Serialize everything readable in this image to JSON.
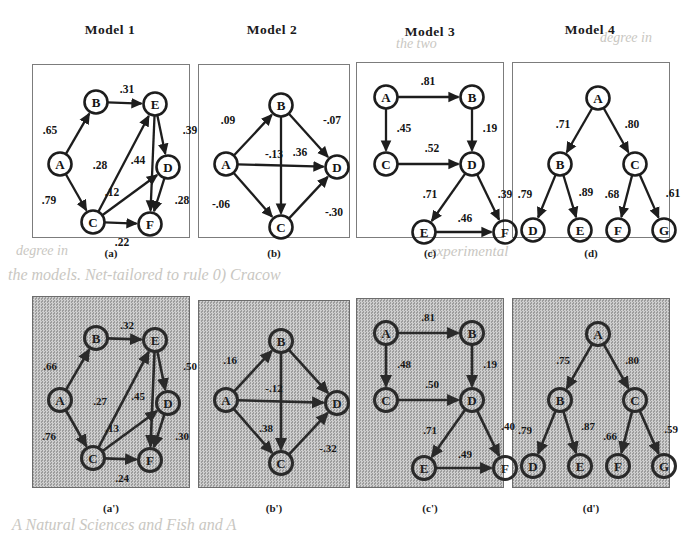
{
  "figure": {
    "title_row": [
      "Model 1",
      "Model 2",
      "Model 3",
      "Model 4"
    ],
    "captions_top": [
      "(a)",
      "(b)",
      "(c)",
      "(d)"
    ],
    "captions_bottom": [
      "(a')",
      "(b')",
      "(c')",
      "(d')"
    ],
    "background_bleed_text": [
      "the two",
      "experimental",
      "degree in",
      "the models. Net-tailored to rule 0) Cracow",
      "A Natural Sciences and Fish and A",
      "degree in"
    ]
  },
  "colors": {
    "ink": "#1d1d1d",
    "panel_border": "#7c7c7c",
    "panel_background": "#ffffff",
    "dithered_background": "#b9b9b9",
    "bleed_text": "#c9c7c2"
  },
  "chart_data": [
    {
      "type": "diagram",
      "id": "model-1-a",
      "title": "Model 1",
      "caption": "(a)",
      "style": "clean",
      "nodes": [
        {
          "id": "A",
          "label": "A",
          "x": 22,
          "y": 92
        },
        {
          "id": "B",
          "label": "B",
          "x": 58,
          "y": 30
        },
        {
          "id": "C",
          "label": "C",
          "x": 55,
          "y": 150
        },
        {
          "id": "D",
          "label": "D",
          "x": 130,
          "y": 95
        },
        {
          "id": "E",
          "label": "E",
          "x": 117,
          "y": 32
        },
        {
          "id": "F",
          "label": "F",
          "x": 112,
          "y": 152
        }
      ],
      "edges": [
        {
          "from": "A",
          "to": "B",
          "weight": ".65",
          "lx": 12,
          "ly": 58
        },
        {
          "from": "B",
          "to": "E",
          "weight": ".31",
          "lx": 89,
          "ly": 17
        },
        {
          "from": "A",
          "to": "C",
          "weight": ".79",
          "lx": 11,
          "ly": 128
        },
        {
          "from": "C",
          "to": "E",
          "weight": ".28",
          "lx": 62,
          "ly": 93
        },
        {
          "from": "C",
          "to": "D",
          "weight": ".12",
          "lx": 74,
          "ly": 120
        },
        {
          "from": "E",
          "to": "D",
          "weight": ".39",
          "lx": 152,
          "ly": 58
        },
        {
          "from": "E",
          "to": "F",
          "weight": ".44",
          "lx": 100,
          "ly": 88
        },
        {
          "from": "D",
          "to": "F",
          "weight": ".28",
          "lx": 144,
          "ly": 128
        },
        {
          "from": "C",
          "to": "F",
          "weight": ".22",
          "lx": 84,
          "ly": 170
        }
      ]
    },
    {
      "type": "diagram",
      "id": "model-2-b",
      "title": "Model 2",
      "caption": "(b)",
      "style": "clean",
      "nodes": [
        {
          "id": "A",
          "label": "A",
          "x": 22,
          "y": 92
        },
        {
          "id": "B",
          "label": "B",
          "x": 77,
          "y": 33
        },
        {
          "id": "C",
          "label": "C",
          "x": 77,
          "y": 155
        },
        {
          "id": "D",
          "label": "D",
          "x": 133,
          "y": 95
        }
      ],
      "edges": [
        {
          "from": "A",
          "to": "B",
          "weight": ".09",
          "lx": 24,
          "ly": 48
        },
        {
          "from": "B",
          "to": "D",
          "weight": "-.07",
          "lx": 128,
          "ly": 48
        },
        {
          "from": "A",
          "to": "D",
          "weight": "-.13",
          "lx": 70,
          "ly": 82
        },
        {
          "from": "B",
          "to": "C",
          "weight": ".36",
          "lx": 96,
          "ly": 80
        },
        {
          "from": "A",
          "to": "C",
          "weight": "-.06",
          "lx": 17,
          "ly": 132
        },
        {
          "from": "C",
          "to": "D",
          "weight": "-.30",
          "lx": 130,
          "ly": 140
        }
      ]
    },
    {
      "type": "diagram",
      "id": "model-3-c",
      "title": "Model 3",
      "caption": "(c)",
      "style": "clean",
      "nodes": [
        {
          "id": "A",
          "label": "A",
          "x": 24,
          "y": 25
        },
        {
          "id": "B",
          "label": "B",
          "x": 110,
          "y": 25
        },
        {
          "id": "C",
          "label": "C",
          "x": 24,
          "y": 92
        },
        {
          "id": "D",
          "label": "D",
          "x": 110,
          "y": 92
        },
        {
          "id": "E",
          "label": "E",
          "x": 62,
          "y": 160
        },
        {
          "id": "F",
          "label": "F",
          "x": 143,
          "y": 160
        }
      ],
      "edges": [
        {
          "from": "A",
          "to": "B",
          "weight": ".81",
          "lx": 66,
          "ly": 9
        },
        {
          "from": "A",
          "to": "C",
          "weight": ".45",
          "lx": 42,
          "ly": 56
        },
        {
          "from": "B",
          "to": "D",
          "weight": ".19",
          "lx": 128,
          "ly": 56
        },
        {
          "from": "C",
          "to": "D",
          "weight": ".52",
          "lx": 70,
          "ly": 76
        },
        {
          "from": "D",
          "to": "E",
          "weight": ".71",
          "lx": 68,
          "ly": 122
        },
        {
          "from": "D",
          "to": "F",
          "weight": ".39",
          "lx": 143,
          "ly": 122
        },
        {
          "from": "E",
          "to": "F",
          "weight": ".46",
          "lx": 103,
          "ly": 146
        }
      ]
    },
    {
      "type": "diagram",
      "id": "model-4-d",
      "title": "Model 4",
      "caption": "(d)",
      "style": "clean",
      "nodes": [
        {
          "id": "A",
          "label": "A",
          "x": 80,
          "y": 26
        },
        {
          "id": "B",
          "label": "B",
          "x": 42,
          "y": 92
        },
        {
          "id": "C",
          "label": "C",
          "x": 117,
          "y": 92
        },
        {
          "id": "D",
          "label": "D",
          "x": 15,
          "y": 158
        },
        {
          "id": "E",
          "label": "E",
          "x": 62,
          "y": 158
        },
        {
          "id": "F",
          "label": "F",
          "x": 100,
          "y": 158
        },
        {
          "id": "G",
          "label": "G",
          "x": 146,
          "y": 158
        }
      ],
      "edges": [
        {
          "from": "A",
          "to": "B",
          "weight": ".71",
          "lx": 45,
          "ly": 52
        },
        {
          "from": "A",
          "to": "C",
          "weight": ".80",
          "lx": 114,
          "ly": 52
        },
        {
          "from": "B",
          "to": "D",
          "weight": ".79",
          "lx": 7,
          "ly": 122
        },
        {
          "from": "B",
          "to": "E",
          "weight": ".89",
          "lx": 68,
          "ly": 120
        },
        {
          "from": "C",
          "to": "F",
          "weight": ".68",
          "lx": 94,
          "ly": 122
        },
        {
          "from": "C",
          "to": "G",
          "weight": ".61",
          "lx": 155,
          "ly": 121
        }
      ]
    },
    {
      "type": "diagram",
      "id": "model-1-a-prime",
      "title": "Model 1",
      "caption": "(a')",
      "style": "dithered",
      "nodes": [
        {
          "id": "A",
          "label": "A",
          "x": 22,
          "y": 92
        },
        {
          "id": "B",
          "label": "B",
          "x": 58,
          "y": 30
        },
        {
          "id": "C",
          "label": "C",
          "x": 55,
          "y": 150
        },
        {
          "id": "D",
          "label": "D",
          "x": 130,
          "y": 95
        },
        {
          "id": "E",
          "label": "E",
          "x": 117,
          "y": 32
        },
        {
          "id": "F",
          "label": "F",
          "x": 112,
          "y": 152
        }
      ],
      "edges": [
        {
          "from": "A",
          "to": "B",
          "weight": ".66",
          "lx": 12,
          "ly": 58
        },
        {
          "from": "B",
          "to": "E",
          "weight": ".32",
          "lx": 89,
          "ly": 17
        },
        {
          "from": "A",
          "to": "C",
          "weight": ".76",
          "lx": 11,
          "ly": 128
        },
        {
          "from": "C",
          "to": "E",
          "weight": ".27",
          "lx": 62,
          "ly": 93
        },
        {
          "from": "C",
          "to": "D",
          "weight": ".13",
          "lx": 74,
          "ly": 120
        },
        {
          "from": "E",
          "to": "D",
          "weight": ".50",
          "lx": 152,
          "ly": 58
        },
        {
          "from": "E",
          "to": "F",
          "weight": ".45",
          "lx": 100,
          "ly": 88
        },
        {
          "from": "D",
          "to": "F",
          "weight": ".30",
          "lx": 144,
          "ly": 128
        },
        {
          "from": "C",
          "to": "F",
          "weight": ".24",
          "lx": 84,
          "ly": 170
        }
      ]
    },
    {
      "type": "diagram",
      "id": "model-2-b-prime",
      "title": "Model 2",
      "caption": "(b')",
      "style": "dithered",
      "nodes": [
        {
          "id": "A",
          "label": "A",
          "x": 22,
          "y": 92
        },
        {
          "id": "B",
          "label": "B",
          "x": 77,
          "y": 33
        },
        {
          "id": "C",
          "label": "C",
          "x": 77,
          "y": 155
        },
        {
          "id": "D",
          "label": "D",
          "x": 133,
          "y": 95
        }
      ],
      "edges": [
        {
          "from": "A",
          "to": "B",
          "weight": ".16",
          "lx": 26,
          "ly": 52
        },
        {
          "from": "B",
          "to": "D",
          "weight": "",
          "lx": 126,
          "ly": 48
        },
        {
          "from": "A",
          "to": "D",
          "weight": "-.12",
          "lx": 70,
          "ly": 80
        },
        {
          "from": "B",
          "to": "C",
          "weight": ".38",
          "lx": 62,
          "ly": 120
        },
        {
          "from": "A",
          "to": "C",
          "weight": "",
          "lx": 17,
          "ly": 132
        },
        {
          "from": "C",
          "to": "D",
          "weight": "-.32",
          "lx": 124,
          "ly": 140
        }
      ]
    },
    {
      "type": "diagram",
      "id": "model-3-c-prime",
      "title": "Model 3",
      "caption": "(c')",
      "style": "dithered",
      "nodes": [
        {
          "id": "A",
          "label": "A",
          "x": 24,
          "y": 25
        },
        {
          "id": "B",
          "label": "B",
          "x": 110,
          "y": 25
        },
        {
          "id": "C",
          "label": "C",
          "x": 24,
          "y": 92
        },
        {
          "id": "D",
          "label": "D",
          "x": 110,
          "y": 92
        },
        {
          "id": "E",
          "label": "E",
          "x": 62,
          "y": 160
        },
        {
          "id": "F",
          "label": "F",
          "x": 143,
          "y": 160
        }
      ],
      "edges": [
        {
          "from": "A",
          "to": "B",
          "weight": ".81",
          "lx": 66,
          "ly": 9
        },
        {
          "from": "A",
          "to": "C",
          "weight": ".48",
          "lx": 42,
          "ly": 56
        },
        {
          "from": "B",
          "to": "D",
          "weight": ".19",
          "lx": 128,
          "ly": 56
        },
        {
          "from": "C",
          "to": "D",
          "weight": ".50",
          "lx": 70,
          "ly": 76
        },
        {
          "from": "D",
          "to": "E",
          "weight": ".71",
          "lx": 68,
          "ly": 122
        },
        {
          "from": "D",
          "to": "F",
          "weight": ".40",
          "lx": 146,
          "ly": 118
        },
        {
          "from": "E",
          "to": "F",
          "weight": ".49",
          "lx": 103,
          "ly": 146
        }
      ]
    },
    {
      "type": "diagram",
      "id": "model-4-d-prime",
      "title": "Model 4",
      "caption": "(d')",
      "style": "dithered",
      "nodes": [
        {
          "id": "A",
          "label": "A",
          "x": 80,
          "y": 26
        },
        {
          "id": "B",
          "label": "B",
          "x": 42,
          "y": 92
        },
        {
          "id": "C",
          "label": "C",
          "x": 117,
          "y": 92
        },
        {
          "id": "D",
          "label": "D",
          "x": 15,
          "y": 158
        },
        {
          "id": "E",
          "label": "E",
          "x": 62,
          "y": 158
        },
        {
          "id": "F",
          "label": "F",
          "x": 100,
          "y": 158
        },
        {
          "id": "G",
          "label": "G",
          "x": 146,
          "y": 158
        }
      ],
      "edges": [
        {
          "from": "A",
          "to": "B",
          "weight": ".75",
          "lx": 45,
          "ly": 52
        },
        {
          "from": "A",
          "to": "C",
          "weight": ".80",
          "lx": 114,
          "ly": 52
        },
        {
          "from": "B",
          "to": "D",
          "weight": ".79",
          "lx": 7,
          "ly": 122
        },
        {
          "from": "B",
          "to": "E",
          "weight": ".87",
          "lx": 70,
          "ly": 118
        },
        {
          "from": "C",
          "to": "F",
          "weight": ".66",
          "lx": 92,
          "ly": 128
        },
        {
          "from": "C",
          "to": "G",
          "weight": ".59",
          "lx": 153,
          "ly": 121
        }
      ]
    }
  ]
}
